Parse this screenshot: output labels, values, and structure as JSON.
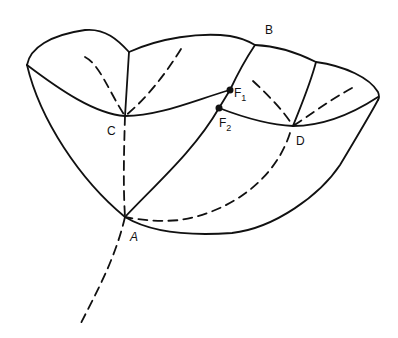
{
  "diagram": {
    "stroke_color": "#111111",
    "background": "#ffffff",
    "points": {
      "A": {
        "label": "A"
      },
      "B": {
        "label": "B"
      },
      "C": {
        "label": "C"
      },
      "D": {
        "label": "D"
      },
      "F1": {
        "label": "F",
        "subscript": "1"
      },
      "F2": {
        "label": "F",
        "subscript": "2"
      }
    }
  }
}
